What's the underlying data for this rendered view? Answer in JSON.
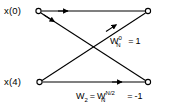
{
  "figure": {
    "type": "fft-butterfly-signal-flow-graph",
    "width": 171,
    "height": 112,
    "background_color": "#ffffff",
    "line_color": "#000000"
  },
  "inputs": [
    {
      "id": "x0",
      "label": "x(0)",
      "node_x": 38,
      "node_y": 11
    },
    {
      "id": "x4",
      "label": "x(4)",
      "node_x": 39,
      "node_y": 82
    }
  ],
  "outputs": [
    {
      "id": "out_top",
      "node_x": 148,
      "node_y": 11
    },
    {
      "id": "out_bottom",
      "node_x": 148,
      "node_y": 82
    }
  ],
  "branches": [
    {
      "id": "top-horizontal",
      "from": "x0",
      "to": "out_top"
    },
    {
      "id": "bottom-horizontal",
      "from": "x4",
      "to": "out_bottom"
    },
    {
      "id": "descending-diagonal",
      "from": "x0",
      "to": "out_bottom"
    },
    {
      "id": "ascending-diagonal",
      "from": "x4",
      "to": "out_top"
    }
  ],
  "annotations": {
    "upper": {
      "base": "W",
      "superscript": "0",
      "subscript": "N",
      "equals": "=",
      "value": "1",
      "plain_text": "W_N^0 = 1"
    },
    "lower": {
      "lhs_base": "W",
      "lhs_subscript": "2",
      "equals_1": "=",
      "rhs_base": "W",
      "rhs_superscript": "N/2",
      "rhs_subscript": "N",
      "equals_2": "=",
      "value": "-1",
      "plain_text": "W_2 = W_N^(N/2) = -1"
    }
  }
}
